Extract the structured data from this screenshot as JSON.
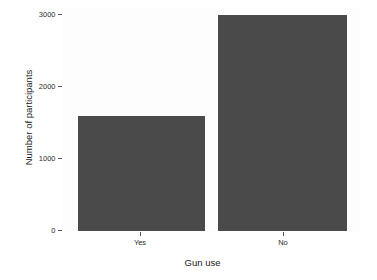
{
  "chart_data": {
    "type": "bar",
    "title": "",
    "xlabel": "Gun use",
    "ylabel": "Number of participants",
    "categories": [
      "Yes",
      "No"
    ],
    "values": [
      1600,
      3000
    ],
    "ylim": [
      0,
      3100
    ],
    "yticks": [
      0,
      1000,
      2000,
      3000
    ],
    "ytick_labels": [
      "0",
      "1000",
      "2000",
      "3000"
    ],
    "grid": false,
    "legend": false,
    "bar_color": "#4a4a4a",
    "panel_background": "#fdfdfd",
    "axis_text_color": "#2b2b2b"
  },
  "axes": {
    "y_title": "Number of participants",
    "x_title": "Gun use",
    "y_ticks": [
      {
        "label": "3000",
        "value": 3000
      },
      {
        "label": "2000",
        "value": 2000
      },
      {
        "label": "1000",
        "value": 1000
      },
      {
        "label": "0",
        "value": 0
      }
    ],
    "x_ticks": [
      {
        "label": "Yes"
      },
      {
        "label": "No"
      }
    ]
  }
}
